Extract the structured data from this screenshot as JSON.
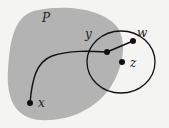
{
  "diagram": {
    "region_label": "P",
    "points": [
      {
        "id": "x",
        "label": "x"
      },
      {
        "id": "y",
        "label": "y"
      },
      {
        "id": "w",
        "label": "w"
      },
      {
        "id": "z",
        "label": "z"
      }
    ],
    "colors": {
      "background": "#f4f4f2",
      "region_fill": "#b3b3b3",
      "stroke": "#111111"
    }
  }
}
